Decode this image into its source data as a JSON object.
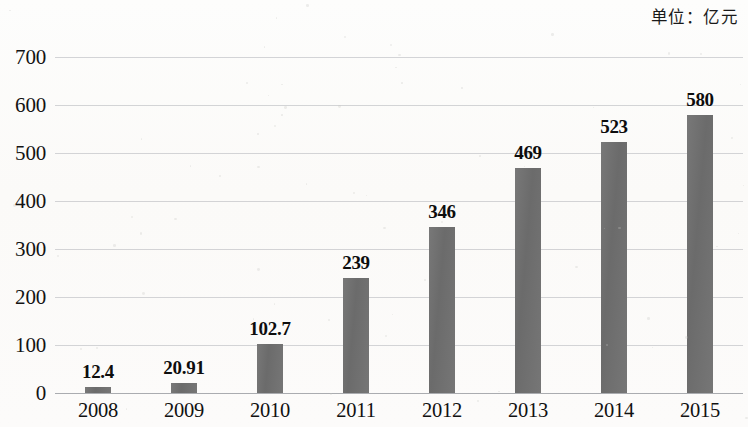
{
  "caption": {
    "unit_label": "单位：亿元"
  },
  "chart_data": {
    "type": "bar",
    "title": "",
    "subtitle": "",
    "unit_note": "单位：亿元",
    "categories": [
      "2008",
      "2009",
      "2010",
      "2011",
      "2012",
      "2013",
      "2014",
      "2015"
    ],
    "values": [
      12.4,
      20.91,
      102.7,
      239,
      346,
      469,
      523,
      580
    ],
    "value_labels": [
      "12.4",
      "20.91",
      "102.7",
      "239",
      "346",
      "469",
      "523",
      "580"
    ],
    "xlabel": "",
    "ylabel": "",
    "ylim": [
      0,
      700
    ],
    "ytick_labels": [
      "0",
      "100",
      "200",
      "300",
      "400",
      "500",
      "600",
      "700"
    ],
    "ytick_values": [
      0,
      100,
      200,
      300,
      400,
      500,
      600,
      700
    ],
    "grid": true,
    "grid_axis": "y",
    "legend": false,
    "legend_position": "none",
    "series": [
      {
        "name": "",
        "color": "#6f6f6f",
        "values": [
          12.4,
          20.91,
          102.7,
          239,
          346,
          469,
          523,
          580
        ]
      }
    ],
    "colors": {
      "bar": "#6f6f6f",
      "gridline": "#b9bcc0",
      "text": "#111111",
      "background": "#fdfcfb"
    }
  }
}
